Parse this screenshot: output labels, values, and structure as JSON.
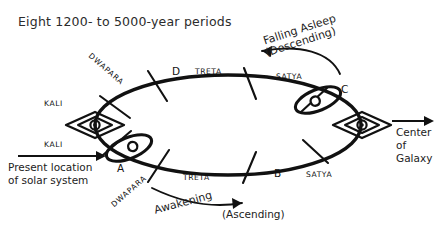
{
  "diagram": {
    "title": "Eight 1200- to 5000-year periods",
    "ink_color": "#111111",
    "background_color": "#ffffff"
  },
  "orbit": {
    "name": "elliptical-yuga-cycle",
    "division_count": 8
  },
  "yuga_labels": {
    "top_dwapara": "DWAPARA",
    "top_kali": "KALI",
    "bottom_kali": "KALI",
    "bottom_dwapara": "DWAPARA",
    "top_d": "D",
    "top_treta": "TRETA",
    "top_satya": "SATYA",
    "bottom_treta": "TRETA",
    "bottom_b": "B",
    "bottom_satya": "SATYA"
  },
  "points": {
    "a": "A",
    "b": "B",
    "c": "C",
    "d": "D"
  },
  "annotations": {
    "descending_line1": "Falling Asleep",
    "descending_line2": "(Descending)",
    "ascending_line1": "Awakening",
    "ascending_line2": "(Ascending)",
    "present_location_line1": "Present location",
    "present_location_line2": "of solar system",
    "galaxy_line1": "Center",
    "galaxy_line2": "of",
    "galaxy_line3": "Galaxy"
  },
  "icons": {
    "left_eye": "eye-icon",
    "right_eye": "eye-icon",
    "solar_system_a": "small-orbit-icon",
    "solar_system_c": "small-orbit-icon",
    "descending_arrow": "curved-arrow-left-icon",
    "ascending_arrow": "curved-arrow-right-icon",
    "present_location_arrow": "arrow-right-icon",
    "galaxy_arrow": "arrow-right-icon"
  }
}
